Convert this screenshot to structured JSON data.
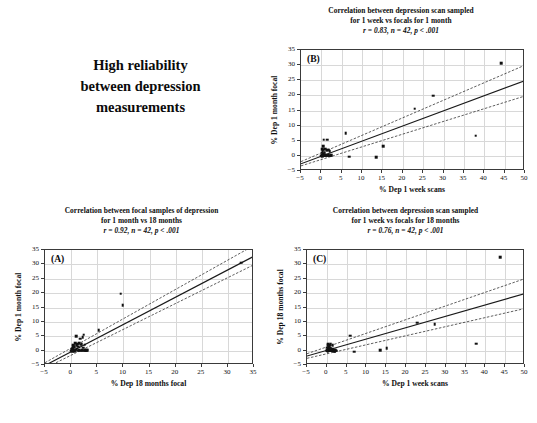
{
  "headline": {
    "line1": "High reliability",
    "line2": "between depression",
    "line3": "measurements"
  },
  "chart_data": [
    {
      "id": "A",
      "panel_letter": "(A)",
      "type": "scatter",
      "title_line1": "Correlation between focal samples of depression",
      "title_line2": "for 1 month vs 18 months",
      "stat_r": "r = 0.92,",
      "stat_n": "n = 42,",
      "stat_p": "p < .001",
      "r": 0.92,
      "n": 42,
      "p": "< .001",
      "xlabel": "% Dep 18 months focal",
      "ylabel": "% Dep 1 month focal",
      "xlim": [
        -5,
        35
      ],
      "ylim": [
        -5,
        35
      ],
      "xticks": [
        -5,
        0,
        5,
        10,
        15,
        20,
        25,
        30,
        35
      ],
      "yticks": [
        -5,
        0,
        5,
        10,
        15,
        20,
        25,
        30,
        35
      ],
      "grid": true,
      "fit": {
        "intercept": -0.4,
        "slope": 0.95
      },
      "ci_upper": {
        "intercept": 0.9,
        "slope": 1.02
      },
      "ci_lower": {
        "intercept": -1.6,
        "slope": 0.9
      },
      "points": [
        [
          0.0,
          0.0
        ],
        [
          0.1,
          0.2
        ],
        [
          0.2,
          -0.1
        ],
        [
          0.25,
          0.5
        ],
        [
          0.3,
          1.0
        ],
        [
          0.35,
          1.6
        ],
        [
          0.4,
          0.0
        ],
        [
          0.45,
          2.0
        ],
        [
          0.5,
          0.3
        ],
        [
          0.55,
          -0.2
        ],
        [
          0.6,
          1.2
        ],
        [
          0.7,
          0.0
        ],
        [
          0.8,
          2.6
        ],
        [
          0.9,
          0.1
        ],
        [
          1.0,
          5.1
        ],
        [
          1.05,
          1.9
        ],
        [
          1.1,
          0.4
        ],
        [
          1.2,
          2.2
        ],
        [
          1.3,
          0.0
        ],
        [
          1.4,
          1.3
        ],
        [
          1.5,
          2.5
        ],
        [
          1.6,
          0.2
        ],
        [
          1.7,
          4.1
        ],
        [
          1.8,
          2.0
        ],
        [
          1.9,
          0.0
        ],
        [
          2.0,
          2.3
        ],
        [
          2.1,
          0.1
        ],
        [
          2.2,
          4.6
        ],
        [
          2.3,
          1.0
        ],
        [
          2.4,
          5.6
        ],
        [
          2.5,
          0.0
        ],
        [
          2.6,
          2.1
        ],
        [
          2.7,
          0.2
        ],
        [
          2.8,
          0.0
        ],
        [
          2.9,
          0.1
        ],
        [
          3.0,
          0.0
        ],
        [
          3.2,
          0.1
        ],
        [
          5.3,
          7.2
        ],
        [
          9.5,
          19.8
        ],
        [
          9.9,
          15.7
        ],
        [
          32.6,
          30.6
        ],
        [
          0.15,
          0.05
        ]
      ]
    },
    {
      "id": "B",
      "panel_letter": "(B)",
      "type": "scatter",
      "title_line1": "Correlation between depression scan sampled",
      "title_line2": "for 1 week vs focals for 1 month",
      "stat_r": "r = 0.83,",
      "stat_n": "n = 42,",
      "stat_p": "p < .001",
      "r": 0.83,
      "n": 42,
      "p": "< .001",
      "xlabel": "% Dep 1 week scans",
      "ylabel": "% Dep 1 month focal",
      "xlim": [
        -5,
        50
      ],
      "ylim": [
        -5,
        35
      ],
      "xticks": [
        -5,
        0,
        5,
        10,
        15,
        20,
        25,
        30,
        35,
        40,
        45,
        50
      ],
      "yticks": [
        -5,
        0,
        5,
        10,
        15,
        20,
        25,
        30,
        35
      ],
      "grid": true,
      "fit": {
        "intercept": -0.1,
        "slope": 0.5
      },
      "ci_upper": {
        "intercept": 1.0,
        "slope": 0.58
      },
      "ci_lower": {
        "intercept": -1.2,
        "slope": 0.42
      },
      "points": [
        [
          0.0,
          0.0
        ],
        [
          0.1,
          0.3
        ],
        [
          0.15,
          1.0
        ],
        [
          0.2,
          -0.2
        ],
        [
          0.25,
          2.2
        ],
        [
          0.3,
          0.1
        ],
        [
          0.35,
          1.5
        ],
        [
          0.4,
          0.0
        ],
        [
          0.45,
          3.1
        ],
        [
          0.5,
          0.5
        ],
        [
          0.55,
          5.4
        ],
        [
          0.6,
          0.0
        ],
        [
          0.65,
          2.0
        ],
        [
          0.7,
          0.2
        ],
        [
          0.75,
          0.0
        ],
        [
          0.8,
          1.1
        ],
        [
          0.85,
          0.3
        ],
        [
          0.9,
          0.0
        ],
        [
          0.95,
          2.4
        ],
        [
          1.0,
          0.1
        ],
        [
          1.1,
          0.0
        ],
        [
          1.2,
          0.4
        ],
        [
          1.3,
          0.0
        ],
        [
          1.4,
          1.8
        ],
        [
          1.5,
          5.4
        ],
        [
          1.6,
          0.0
        ],
        [
          1.7,
          0.2
        ],
        [
          1.8,
          2.0
        ],
        [
          1.9,
          0.0
        ],
        [
          2.0,
          1.6
        ],
        [
          2.1,
          0.1
        ],
        [
          2.2,
          0.0
        ],
        [
          2.4,
          0.3
        ],
        [
          6.0,
          7.4
        ],
        [
          6.9,
          -0.3
        ],
        [
          13.5,
          -0.4
        ],
        [
          15.2,
          3.2
        ],
        [
          22.9,
          15.6
        ],
        [
          27.4,
          19.9
        ],
        [
          37.9,
          6.7
        ],
        [
          44.2,
          30.7
        ],
        [
          0.05,
          0.0
        ]
      ]
    },
    {
      "id": "C",
      "panel_letter": "(C)",
      "type": "scatter",
      "title_line1": "Correlation between depression scan sampled",
      "title_line2": "for 1 week vs focals for 18 months",
      "stat_r": "r = 0.76,",
      "stat_n": "n = 42,",
      "stat_p": "p < .001",
      "r": 0.76,
      "n": 42,
      "p": "< .001",
      "xlabel": "% Dep 1 week scans",
      "ylabel": "% Dep 18 months focal",
      "xlim": [
        -5,
        50
      ],
      "ylim": [
        -5,
        35
      ],
      "xticks": [
        -5,
        0,
        5,
        10,
        15,
        20,
        25,
        30,
        35,
        40,
        45,
        50
      ],
      "yticks": [
        -5,
        0,
        5,
        10,
        15,
        20,
        25,
        30,
        35
      ],
      "grid": true,
      "fit": {
        "intercept": 0.1,
        "slope": 0.395
      },
      "ci_upper": {
        "intercept": 1.3,
        "slope": 0.475
      },
      "ci_lower": {
        "intercept": -1.1,
        "slope": 0.315
      },
      "points": [
        [
          0.0,
          0.0
        ],
        [
          0.1,
          0.2
        ],
        [
          0.15,
          1.0
        ],
        [
          0.2,
          -0.1
        ],
        [
          0.25,
          1.8
        ],
        [
          0.3,
          0.0
        ],
        [
          0.35,
          2.3
        ],
        [
          0.4,
          0.4
        ],
        [
          0.45,
          0.0
        ],
        [
          0.5,
          1.2
        ],
        [
          0.55,
          0.1
        ],
        [
          0.6,
          2.0
        ],
        [
          0.65,
          0.0
        ],
        [
          0.7,
          0.6
        ],
        [
          0.75,
          1.5
        ],
        [
          0.8,
          0.0
        ],
        [
          0.85,
          0.2
        ],
        [
          0.9,
          1.0
        ],
        [
          0.95,
          0.0
        ],
        [
          1.0,
          2.2
        ],
        [
          1.1,
          0.1
        ],
        [
          1.2,
          0.0
        ],
        [
          1.3,
          0.5
        ],
        [
          1.4,
          0.0
        ],
        [
          1.5,
          1.9
        ],
        [
          1.6,
          0.2
        ],
        [
          1.7,
          0.0
        ],
        [
          1.8,
          -0.3
        ],
        [
          1.9,
          0.1
        ],
        [
          2.0,
          -0.2
        ],
        [
          2.1,
          0.0
        ],
        [
          2.2,
          0.3
        ],
        [
          2.4,
          0.0
        ],
        [
          5.9,
          5.2
        ],
        [
          6.9,
          -0.4
        ],
        [
          13.5,
          0.1
        ],
        [
          15.1,
          0.9
        ],
        [
          22.8,
          9.7
        ],
        [
          27.2,
          9.1
        ],
        [
          37.7,
          2.4
        ],
        [
          43.8,
          32.5
        ],
        [
          0.05,
          0.0
        ]
      ]
    }
  ]
}
